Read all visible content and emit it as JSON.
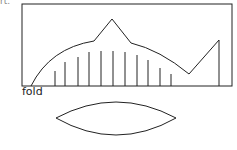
{
  "labels": {
    "top_fragment": "rt.",
    "fold": "fold"
  },
  "colors": {
    "stroke": "#222222",
    "background": "#ffffff"
  },
  "diagram": {
    "frame": {
      "x": 22,
      "y": 4,
      "width": 210,
      "height": 82
    },
    "profile_points": [
      [
        31,
        86
      ],
      [
        94,
        41
      ],
      [
        112,
        19
      ],
      [
        131,
        43
      ],
      [
        189,
        74
      ],
      [
        219,
        40
      ]
    ],
    "vertical_lines": [
      {
        "x": 55,
        "top": 71
      },
      {
        "x": 65,
        "top": 62
      },
      {
        "x": 78,
        "top": 57
      },
      {
        "x": 89,
        "top": 52
      },
      {
        "x": 101,
        "top": 51
      },
      {
        "x": 113,
        "top": 51
      },
      {
        "x": 125,
        "top": 52
      },
      {
        "x": 137,
        "top": 55
      },
      {
        "x": 148,
        "top": 60
      },
      {
        "x": 160,
        "top": 68
      },
      {
        "x": 171,
        "top": 74
      },
      {
        "x": 219,
        "top": 40
      }
    ],
    "lens": {
      "left": 56,
      "right": 176,
      "top": 102,
      "bottom": 137,
      "mid_y": 118
    }
  }
}
